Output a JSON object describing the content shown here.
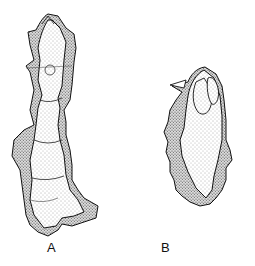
{
  "figure": {
    "panels": [
      {
        "id": "A",
        "label": "A",
        "description": "elongated segmented specimen, stippled"
      },
      {
        "id": "B",
        "label": "B",
        "description": "oval specimen with lobed margin, stippled"
      }
    ],
    "colors": {
      "ink": "#111111",
      "background": "#ffffff",
      "stipple": "#555555"
    }
  }
}
